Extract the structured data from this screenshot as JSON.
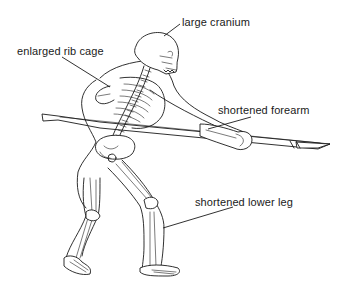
{
  "diagram": {
    "labels": [
      {
        "id": "cranium",
        "text": "large cranium",
        "x": 182,
        "y": 16,
        "leader": {
          "x1": 180,
          "y1": 24,
          "x2": 164,
          "y2": 36
        }
      },
      {
        "id": "ribcage",
        "text": "enlarged rib cage",
        "x": 17,
        "y": 45,
        "leader": {
          "x1": 62,
          "y1": 57,
          "x2": 110,
          "y2": 87
        }
      },
      {
        "id": "forearm",
        "text": "shortened forearm",
        "x": 218,
        "y": 104,
        "leader": {
          "x1": 251,
          "y1": 117,
          "x2": 208,
          "y2": 129
        }
      },
      {
        "id": "lowerleg",
        "text": "shortened lower leg",
        "x": 195,
        "y": 196,
        "leader": {
          "x1": 233,
          "y1": 207,
          "x2": 163,
          "y2": 228
        }
      }
    ],
    "colors": {
      "ink": "#1a1a1a",
      "background": "#ffffff"
    }
  }
}
